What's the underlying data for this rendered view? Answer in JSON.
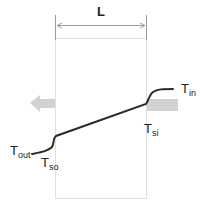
{
  "diagram": {
    "dimension": {
      "label": "L"
    },
    "labels": {
      "t_in": {
        "main": "T",
        "sub": "in"
      },
      "t_out": {
        "main": "T",
        "sub": "out"
      },
      "t_si": {
        "main": "T",
        "sub": "si"
      },
      "t_so": {
        "main": "T",
        "sub": "so"
      }
    },
    "arrows": {
      "heat_in": {
        "direction": "left",
        "color": "#d0d0d0"
      },
      "heat_out": {
        "direction": "left",
        "color": "#d0d0d0"
      }
    },
    "colors": {
      "profile_line": "#2a2a2a",
      "wall_outline": "#dcdcdc",
      "dimension_line": "#999999",
      "arrow_fill": "#cfcfcf"
    }
  }
}
